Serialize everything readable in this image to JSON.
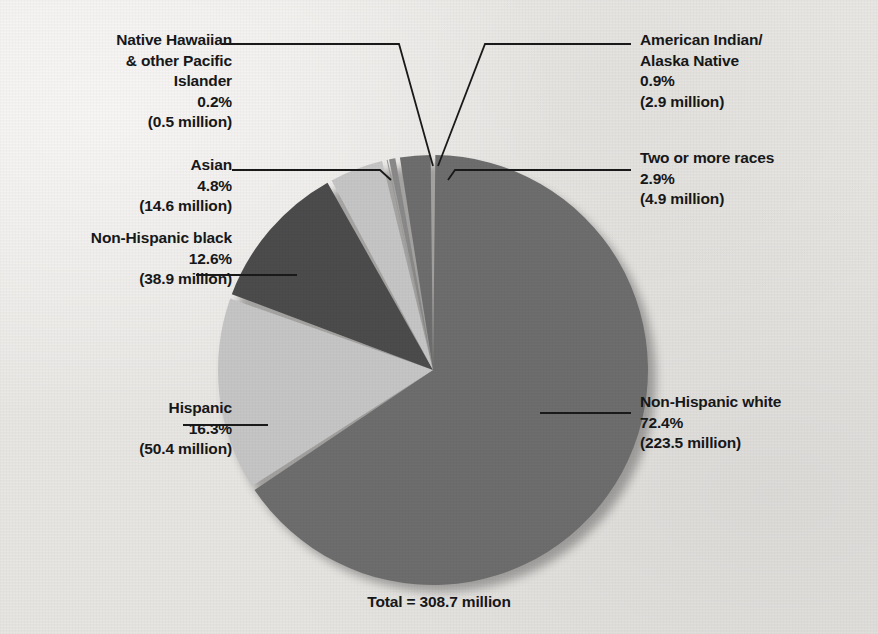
{
  "chart_data": {
    "type": "pie",
    "title": "",
    "total_label": "Total = 308.7 million",
    "total_value": 308.7,
    "units": "million",
    "legend_position": "callouts",
    "categories": [
      "Non-Hispanic white",
      "Hispanic",
      "Non-Hispanic black",
      "Asian",
      "Two or more races",
      "American Indian/Alaska Native",
      "Native Hawaiian & other Pacific Islander"
    ],
    "values": [
      72.4,
      16.3,
      12.6,
      4.8,
      2.9,
      0.9,
      0.2
    ],
    "counts": [
      223.5,
      50.4,
      38.9,
      14.6,
      4.9,
      2.9,
      0.5
    ],
    "slices": [
      {
        "key": "nhwhite",
        "name": "Non-Hispanic white",
        "percent": "72.4%",
        "percent_value": 72.4,
        "count": "(223.5 million)",
        "count_value": 223.5,
        "color": "#6e6e6e"
      },
      {
        "key": "hispanic",
        "name": "Hispanic",
        "percent": "16.3%",
        "percent_value": 16.3,
        "count": "(50.4 million)",
        "count_value": 50.4,
        "color": "#c6c6c6"
      },
      {
        "key": "nhblack",
        "name": "Non-Hispanic black",
        "percent": "12.6%",
        "percent_value": 12.6,
        "count": "(38.9 million)",
        "count_value": 38.9,
        "color": "#4c4c4c"
      },
      {
        "key": "asian",
        "name": "Asian",
        "percent": "4.8%",
        "percent_value": 4.8,
        "count": "(14.6 million)",
        "count_value": 14.6,
        "color": "#c6c6c6"
      },
      {
        "key": "nhpi",
        "name": "Native Hawaiian & other Pacific Islander",
        "name_line1": "Native Hawaiian",
        "name_line2": "& other Pacific",
        "name_line3": "Islander",
        "percent": "0.2%",
        "percent_value": 0.2,
        "count": "(0.5 million)",
        "count_value": 0.5,
        "color": "#9a9a9a"
      },
      {
        "key": "aian",
        "name": "American Indian/Alaska Native",
        "name_line1": "American Indian/",
        "name_line2": "Alaska Native",
        "percent": "0.9%",
        "percent_value": 0.9,
        "count": "(2.9 million)",
        "count_value": 2.9,
        "color": "#8a8a8a"
      },
      {
        "key": "tomr",
        "name": "Two or more races",
        "percent": "2.9%",
        "percent_value": 2.9,
        "count": "(4.9 million)",
        "count_value": 4.9,
        "color": "#6e6e6e"
      }
    ],
    "background_color": "#eceae7",
    "text_color": "#17181a"
  }
}
